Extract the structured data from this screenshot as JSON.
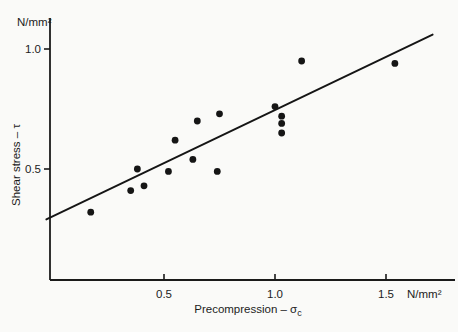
{
  "labels": {
    "y_unit": "N/mm²",
    "x_unit": "N/mm²",
    "y_axis_title": "Shear stress – τ",
    "x_axis_title_main": "Precompression – σ",
    "x_axis_title_sub": "c"
  },
  "chart_data": {
    "type": "scatter",
    "title": "",
    "xlabel": "Precompression – σc (N/mm²)",
    "ylabel": "Shear stress – τ (N/mm²)",
    "xlim": [
      0,
      1.82
    ],
    "ylim": [
      0,
      1.12
    ],
    "x_ticks": [
      0.5,
      1.0,
      1.5
    ],
    "y_ticks": [
      0.5,
      1.0
    ],
    "grid": false,
    "legend": false,
    "point_color": "#151515",
    "line_color": "#151515",
    "axis_color": "#1a1a1a",
    "points": [
      {
        "x": 0.17,
        "y": 0.32
      },
      {
        "x": 0.35,
        "y": 0.41
      },
      {
        "x": 0.38,
        "y": 0.5
      },
      {
        "x": 0.41,
        "y": 0.43
      },
      {
        "x": 0.52,
        "y": 0.49
      },
      {
        "x": 0.55,
        "y": 0.62
      },
      {
        "x": 0.63,
        "y": 0.54
      },
      {
        "x": 0.65,
        "y": 0.7
      },
      {
        "x": 0.74,
        "y": 0.49
      },
      {
        "x": 0.75,
        "y": 0.73
      },
      {
        "x": 1.0,
        "y": 0.76
      },
      {
        "x": 1.03,
        "y": 0.72
      },
      {
        "x": 1.03,
        "y": 0.69
      },
      {
        "x": 1.03,
        "y": 0.65
      },
      {
        "x": 1.12,
        "y": 0.95
      },
      {
        "x": 1.54,
        "y": 0.94
      }
    ],
    "trend_line": {
      "x1": -0.03,
      "y1": 0.29,
      "x2": 1.71,
      "y2": 1.06
    }
  }
}
